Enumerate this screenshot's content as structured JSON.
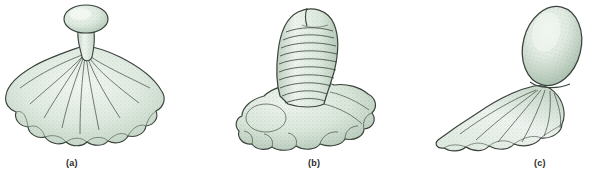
{
  "figure": {
    "background_color": "#ffffff",
    "ink_color": "#2f2f2f",
    "body_fill_light": "#eef4ef",
    "body_fill_mid": "#d6e3d8",
    "body_fill_shadow": "#b9cdbd",
    "caption_color": "#2b2b2b",
    "panels": [
      {
        "id": "a",
        "caption": "(a)",
        "subject": "stalked organism with broad scalloped lobed skirt and small ovoid knob on slender stalk",
        "icon_name": "stalked-lobed-organism-a"
      },
      {
        "id": "b",
        "caption": "(b)",
        "subject": "thick ringed upright column with rounded notched top rising from a bulbous lobed base",
        "icon_name": "ringed-column-organism-b"
      },
      {
        "id": "c",
        "caption": "(c)",
        "subject": "tilted elongated ovoid head atop a fanned lobed foot extending to the left",
        "icon_name": "tilted-ovoid-organism-c"
      }
    ]
  }
}
